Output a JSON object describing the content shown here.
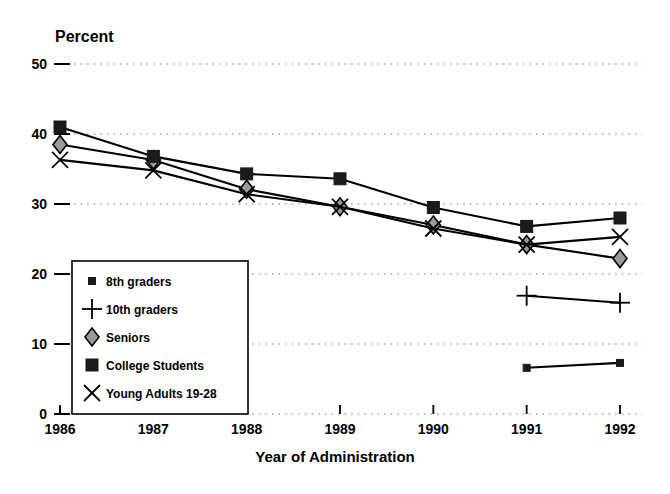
{
  "chart_data": {
    "type": "line",
    "title": "",
    "xlabel": "Year of Administration",
    "ylabel": "Percent",
    "x": [
      1986,
      1987,
      1988,
      1989,
      1990,
      1991,
      1992
    ],
    "xticklabels": [
      "1986",
      "1987",
      "1988",
      "1989",
      "1990",
      "1991",
      "1992"
    ],
    "yticklabels": [
      "0",
      "10",
      "20",
      "30",
      "40",
      "50"
    ],
    "yticks": [
      0,
      10,
      20,
      30,
      40,
      50
    ],
    "ylim": [
      0,
      50
    ],
    "xlim": [
      1986,
      1992
    ],
    "grid": "horizontal-dotted",
    "legend_position": "lower-left-inside",
    "series": [
      {
        "name": "8th graders",
        "marker": "small-filled-square",
        "x": [
          1991,
          1992
        ],
        "values": [
          6.6,
          7.3
        ]
      },
      {
        "name": "10th graders",
        "marker": "plus",
        "x": [
          1991,
          1992
        ],
        "values": [
          16.9,
          15.9
        ]
      },
      {
        "name": "Seniors",
        "marker": "diamond",
        "x": [
          1986,
          1987,
          1988,
          1989,
          1990,
          1991,
          1992
        ],
        "values": [
          38.5,
          36.3,
          32.1,
          29.6,
          27.0,
          24.2,
          22.2
        ]
      },
      {
        "name": "College Students",
        "marker": "filled-square",
        "x": [
          1986,
          1987,
          1988,
          1989,
          1990,
          1991,
          1992
        ],
        "values": [
          41.0,
          36.8,
          34.3,
          33.6,
          29.5,
          26.8,
          28.0
        ]
      },
      {
        "name": "Young Adults 19-28",
        "marker": "x-cross",
        "x": [
          1986,
          1987,
          1988,
          1989,
          1990,
          1991,
          1992
        ],
        "values": [
          36.3,
          34.8,
          31.4,
          29.6,
          26.5,
          24.2,
          25.3
        ]
      }
    ],
    "colors": {
      "line": "#000000",
      "marker_fill_dark": "#1a1a1a",
      "marker_fill_light": "#9a9a9a",
      "grid": "#6b6b6b",
      "axis": "#000000",
      "background": "#ffffff"
    }
  },
  "legend": {
    "items": [
      {
        "label": "8th graders",
        "marker": "small-filled-square"
      },
      {
        "label": "10th graders",
        "marker": "plus"
      },
      {
        "label": "Seniors",
        "marker": "diamond"
      },
      {
        "label": "College Students",
        "marker": "filled-square"
      },
      {
        "label": "Young Adults 19-28",
        "marker": "x-cross"
      }
    ]
  }
}
